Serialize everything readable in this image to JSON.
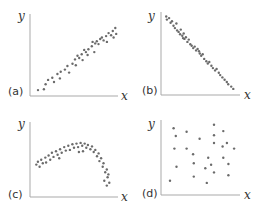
{
  "chart_data": [
    {
      "type": "scatter",
      "panel_label": "(a)",
      "title": "",
      "xlabel": "x",
      "ylabel": "y",
      "xlim": [
        0,
        10
      ],
      "ylim": [
        0,
        10
      ],
      "grid": false,
      "description": "strong positive linear correlation",
      "points": [
        [
          0.6,
          0.4
        ],
        [
          1.3,
          0.5
        ],
        [
          1.5,
          1.2
        ],
        [
          1.8,
          1.8
        ],
        [
          2.3,
          2.1
        ],
        [
          2.5,
          1.5
        ],
        [
          2.9,
          2.6
        ],
        [
          3.3,
          2.9
        ],
        [
          3.2,
          2.0
        ],
        [
          3.8,
          3.2
        ],
        [
          4.1,
          3.7
        ],
        [
          4.3,
          2.8
        ],
        [
          4.7,
          4.0
        ],
        [
          5.0,
          4.6
        ],
        [
          5.1,
          3.8
        ],
        [
          5.5,
          4.8
        ],
        [
          5.8,
          5.3
        ],
        [
          5.9,
          4.5
        ],
        [
          6.3,
          5.6
        ],
        [
          6.6,
          6.0
        ],
        [
          6.5,
          5.2
        ],
        [
          7.0,
          6.4
        ],
        [
          7.3,
          5.6
        ],
        [
          7.4,
          6.8
        ],
        [
          7.6,
          7.1
        ],
        [
          7.8,
          6.7
        ],
        [
          8.0,
          7.4
        ],
        [
          8.2,
          7.6
        ],
        [
          8.4,
          7.2
        ],
        [
          8.7,
          7.8
        ],
        [
          8.8,
          7.0
        ],
        [
          9.0,
          8.2
        ],
        [
          9.3,
          7.9
        ],
        [
          9.5,
          8.5
        ],
        [
          9.6,
          7.6
        ],
        [
          9.8,
          8.9
        ],
        [
          9.9,
          8.1
        ],
        [
          6.1,
          5.9
        ],
        [
          5.3,
          5.1
        ],
        [
          7.1,
          7.0
        ]
      ]
    },
    {
      "type": "scatter",
      "panel_label": "(b)",
      "title": "",
      "xlabel": "x",
      "ylabel": "y",
      "xlim": [
        0,
        10
      ],
      "ylim": [
        0,
        10
      ],
      "grid": false,
      "description": "strong negative linear correlation",
      "points": [
        [
          0.3,
          9.8
        ],
        [
          0.4,
          9.4
        ],
        [
          0.7,
          9.6
        ],
        [
          0.9,
          9.0
        ],
        [
          1.1,
          9.2
        ],
        [
          1.3,
          8.6
        ],
        [
          1.5,
          8.3
        ],
        [
          1.7,
          8.9
        ],
        [
          1.8,
          8.0
        ],
        [
          2.0,
          7.8
        ],
        [
          2.2,
          7.5
        ],
        [
          2.3,
          8.1
        ],
        [
          2.5,
          7.3
        ],
        [
          2.7,
          7.6
        ],
        [
          2.8,
          6.9
        ],
        [
          3.0,
          7.1
        ],
        [
          3.2,
          6.5
        ],
        [
          3.4,
          6.8
        ],
        [
          3.6,
          6.2
        ],
        [
          3.8,
          6.0
        ],
        [
          4.0,
          5.7
        ],
        [
          4.2,
          5.9
        ],
        [
          4.4,
          5.4
        ],
        [
          4.6,
          5.6
        ],
        [
          4.9,
          5.0
        ],
        [
          5.1,
          4.7
        ],
        [
          5.3,
          4.9
        ],
        [
          5.5,
          4.3
        ],
        [
          5.8,
          4.0
        ],
        [
          6.0,
          3.7
        ],
        [
          6.2,
          3.9
        ],
        [
          6.5,
          3.4
        ],
        [
          6.7,
          3.1
        ],
        [
          7.0,
          2.8
        ],
        [
          7.2,
          3.0
        ],
        [
          7.5,
          2.5
        ],
        [
          7.7,
          2.2
        ],
        [
          8.0,
          1.9
        ],
        [
          8.3,
          1.6
        ],
        [
          8.6,
          1.3
        ],
        [
          8.8,
          1.0
        ],
        [
          9.2,
          0.7
        ],
        [
          9.5,
          0.4
        ],
        [
          4.8,
          5.3
        ],
        [
          2.6,
          7.0
        ]
      ]
    },
    {
      "type": "scatter",
      "panel_label": "(c)",
      "title": "",
      "xlabel": "x",
      "ylabel": "y",
      "xlim": [
        0,
        10
      ],
      "ylim": [
        0,
        10
      ],
      "grid": false,
      "description": "curvilinear (inverted-U) relationship",
      "points": [
        [
          0.4,
          4.2
        ],
        [
          0.6,
          4.6
        ],
        [
          0.8,
          3.9
        ],
        [
          1.0,
          4.9
        ],
        [
          1.2,
          4.4
        ],
        [
          1.5,
          5.2
        ],
        [
          1.6,
          4.5
        ],
        [
          1.9,
          5.5
        ],
        [
          2.1,
          4.9
        ],
        [
          2.3,
          5.9
        ],
        [
          2.5,
          5.3
        ],
        [
          2.8,
          6.1
        ],
        [
          3.0,
          5.6
        ],
        [
          3.3,
          6.4
        ],
        [
          3.5,
          5.9
        ],
        [
          3.8,
          6.7
        ],
        [
          4.0,
          6.2
        ],
        [
          4.3,
          6.9
        ],
        [
          4.5,
          6.3
        ],
        [
          4.8,
          7.1
        ],
        [
          5.0,
          6.6
        ],
        [
          5.3,
          7.2
        ],
        [
          5.5,
          6.7
        ],
        [
          5.8,
          7.3
        ],
        [
          6.0,
          6.9
        ],
        [
          6.3,
          7.2
        ],
        [
          6.5,
          6.6
        ],
        [
          6.7,
          7.0
        ],
        [
          7.0,
          6.4
        ],
        [
          7.2,
          6.8
        ],
        [
          7.4,
          6.0
        ],
        [
          7.6,
          6.3
        ],
        [
          7.8,
          5.4
        ],
        [
          8.0,
          5.8
        ],
        [
          8.1,
          4.7
        ],
        [
          8.3,
          5.1
        ],
        [
          8.5,
          3.9
        ],
        [
          8.6,
          4.4
        ],
        [
          8.8,
          3.1
        ],
        [
          9.0,
          3.5
        ],
        [
          9.1,
          2.4
        ],
        [
          9.2,
          2.8
        ],
        [
          9.3,
          1.6
        ],
        [
          9.0,
          1.2
        ],
        [
          8.7,
          1.9
        ],
        [
          6.1,
          6.1
        ],
        [
          5.6,
          6.0
        ],
        [
          3.2,
          5.1
        ]
      ]
    },
    {
      "type": "scatter",
      "panel_label": "(d)",
      "title": "",
      "xlabel": "x",
      "ylabel": "y",
      "xlim": [
        0,
        10
      ],
      "ylim": [
        0,
        10
      ],
      "grid": false,
      "description": "no correlation (random scatter)",
      "points": [
        [
          1.2,
          9.1
        ],
        [
          1.5,
          8.0
        ],
        [
          3.0,
          8.6
        ],
        [
          4.8,
          7.6
        ],
        [
          6.8,
          9.6
        ],
        [
          6.8,
          8.1
        ],
        [
          8.1,
          8.7
        ],
        [
          8.6,
          7.0
        ],
        [
          9.6,
          6.2
        ],
        [
          1.3,
          6.2
        ],
        [
          3.0,
          6.2
        ],
        [
          3.9,
          5.4
        ],
        [
          6.8,
          7.0
        ],
        [
          8.0,
          6.5
        ],
        [
          1.6,
          3.6
        ],
        [
          6.0,
          4.9
        ],
        [
          8.1,
          4.9
        ],
        [
          4.0,
          4.1
        ],
        [
          6.4,
          3.9
        ],
        [
          8.8,
          4.0
        ],
        [
          5.6,
          3.4
        ],
        [
          0.7,
          1.6
        ],
        [
          4.0,
          2.2
        ],
        [
          6.8,
          2.8
        ],
        [
          5.8,
          1.3
        ],
        [
          8.8,
          2.4
        ]
      ]
    }
  ]
}
